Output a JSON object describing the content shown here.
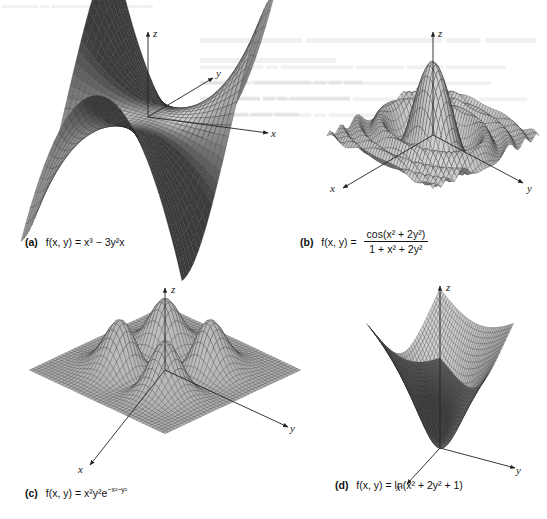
{
  "figure": {
    "panels": [
      {
        "id": "a",
        "tag": "(a)",
        "caption_lhs": "f(x, y) =",
        "caption_rhs": "x³ − 3y²x",
        "axes": [
          "x",
          "y",
          "z"
        ]
      },
      {
        "id": "b",
        "tag": "(b)",
        "caption_lhs": "f(x, y) =",
        "caption_num": "cos(x² + 2y²)",
        "caption_den": "1 + x² + 2y²",
        "axes": [
          "x",
          "y",
          "z"
        ]
      },
      {
        "id": "c",
        "tag": "(c)",
        "caption_lhs": "f(x, y) =",
        "caption_rhs": "x²y²e^(−x²−y²)",
        "caption_base": "x²y²e",
        "caption_exp": "−x²−y²",
        "axes": [
          "x",
          "y",
          "z"
        ]
      },
      {
        "id": "d",
        "tag": "(d)",
        "caption_lhs": "f(x, y) =",
        "caption_rhs": "ln(x² + 2y² + 1)",
        "axes": [
          "x",
          "y",
          "z"
        ]
      }
    ]
  },
  "chart_data": [
    {
      "type": "surface",
      "title": "(a) f(x, y) = x³ − 3y²x",
      "function": "x^3 - 3*y^2*x",
      "xlabel": "x",
      "ylabel": "y",
      "zlabel": "z",
      "x_range": [
        -1.5,
        1.5
      ],
      "y_range": [
        -1.5,
        1.5
      ],
      "grid": true
    },
    {
      "type": "surface",
      "title": "(b) f(x, y) = cos(x² + 2y²) / (1 + x² + 2y²)",
      "function": "cos(x^2 + 2*y^2) / (1 + x^2 + 2*y^2)",
      "xlabel": "x",
      "ylabel": "y",
      "zlabel": "z",
      "x_range": [
        -3,
        3
      ],
      "y_range": [
        -3,
        3
      ],
      "grid": true
    },
    {
      "type": "surface",
      "title": "(c) f(x, y) = x²y²e^(−x²−y²)",
      "function": "x^2 * y^2 * exp(-x^2 - y^2)",
      "xlabel": "x",
      "ylabel": "y",
      "zlabel": "z",
      "x_range": [
        -3,
        3
      ],
      "y_range": [
        -3,
        3
      ],
      "grid": true
    },
    {
      "type": "surface",
      "title": "(d) f(x, y) = ln(x² + 2y² + 1)",
      "function": "ln(x^2 + 2*y^2 + 1)",
      "xlabel": "x",
      "ylabel": "y",
      "zlabel": "z",
      "x_range": [
        -2,
        2
      ],
      "y_range": [
        -2,
        2
      ],
      "grid": true
    }
  ]
}
